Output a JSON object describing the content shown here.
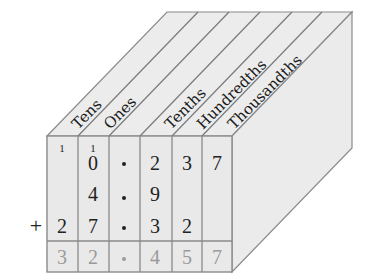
{
  "diagram": {
    "column_labels": [
      "Tens",
      "Ones",
      "Tenths",
      "Hundredths",
      "Thousandths"
    ],
    "carries": {
      "tens": "1",
      "ones": "1"
    },
    "rows": [
      [
        "",
        "0",
        ".",
        "2",
        "3",
        "7"
      ],
      [
        "",
        "4",
        ".",
        "9",
        "",
        ""
      ],
      [
        "2",
        "7",
        ".",
        "3",
        "2",
        ""
      ]
    ],
    "operator": "+",
    "sum": [
      "3",
      "2",
      ".",
      "4",
      "5",
      "7"
    ],
    "colors": {
      "face": "#ececec",
      "edge": "#8a8a8a",
      "sum_text": "#9a9a9a"
    }
  }
}
